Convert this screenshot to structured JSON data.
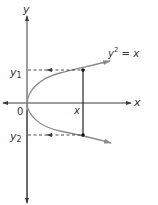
{
  "diagram": {
    "type": "parabola-graph",
    "equation": {
      "base": "y",
      "exponent": "2",
      "rest": " = x"
    },
    "axes": {
      "x_label": "x",
      "y_label": "y",
      "origin_label": "0"
    },
    "points": {
      "x_label": "x",
      "y1_base": "y",
      "y1_sub": "1",
      "y2_base": "y",
      "y2_sub": "2"
    },
    "colors": {
      "axis": "#3a3a3a",
      "curve": "#8a8a8a",
      "text": "#333333",
      "dashed": "#3a3a3a"
    }
  }
}
